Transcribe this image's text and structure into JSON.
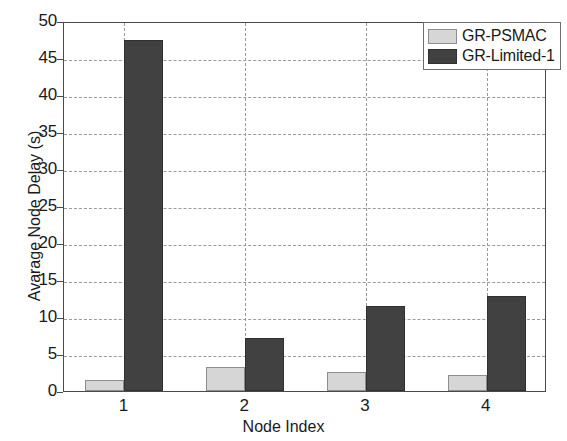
{
  "chart_data": {
    "type": "bar",
    "title": "",
    "subtitle": "",
    "xlabel": "Node Index",
    "ylabel": "Avarage Node Delay (s)",
    "categories": [
      "1",
      "2",
      "3",
      "4"
    ],
    "series": [
      {
        "name": "GR-PSMAC",
        "color": "#d6d6d6",
        "values": [
          1.5,
          3.2,
          2.6,
          2.2
        ]
      },
      {
        "name": "GR-Limited-1",
        "color": "#414141",
        "values": [
          47.4,
          7.1,
          11.5,
          12.8
        ]
      }
    ],
    "ylim": [
      0,
      50
    ],
    "yticks": [
      0,
      5,
      10,
      15,
      20,
      25,
      30,
      35,
      40,
      45,
      50
    ],
    "ytick_labels": [
      "0",
      "5",
      "10",
      "15",
      "20",
      "25",
      "30",
      "35",
      "40",
      "45",
      "50"
    ],
    "xtick_labels": [
      "1",
      "2",
      "3",
      "4"
    ],
    "grid": true,
    "grid_style": "dashed",
    "grid_color": "#9a9a9a",
    "legend_position": "top-right",
    "legend_entries": [
      "GR-PSMAC",
      "GR-Limited-1"
    ],
    "axis_color": "#4a4a4a",
    "background_color": "#ffffff"
  }
}
